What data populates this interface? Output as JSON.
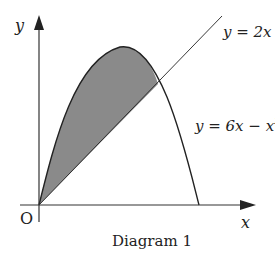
{
  "diagram": {
    "caption": "Diagram 1",
    "axes": {
      "x_label": "x",
      "y_label": "y",
      "origin_label": "O"
    },
    "curves": [
      {
        "name": "line",
        "label": "y = 2x"
      },
      {
        "name": "parabola",
        "label": "y = 6x − x",
        "label_sup": "2"
      }
    ],
    "shaded_region": "area between y = 6x − x² and y = 2x from x = 0 to x = 4",
    "colors": {
      "shade": "#8a8a8a",
      "stroke": "#222222"
    }
  }
}
